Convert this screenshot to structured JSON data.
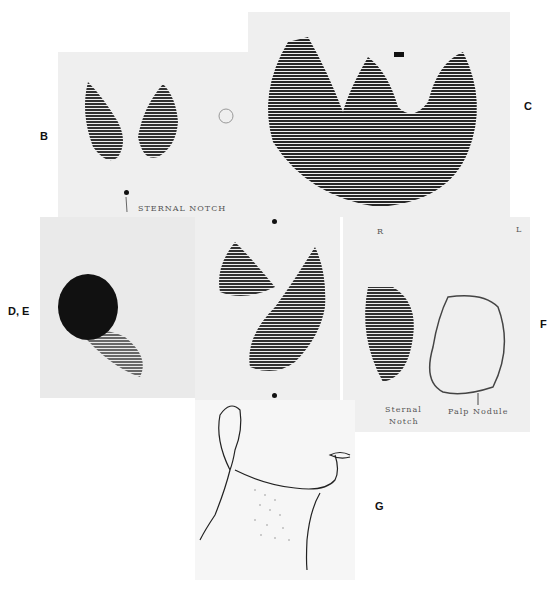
{
  "figure": {
    "panels": [
      {
        "id": "B",
        "label": "B",
        "annotations": [
          "STERNAL NOTCH"
        ]
      },
      {
        "id": "C",
        "label": "C",
        "annotations": []
      },
      {
        "id": "DE",
        "label": "D, E",
        "annotations": []
      },
      {
        "id": "middle",
        "label": "",
        "annotations": []
      },
      {
        "id": "F",
        "label": "F",
        "annotations": [
          "R",
          "L",
          "Sternal",
          "Notch",
          "Palp Nodule"
        ]
      },
      {
        "id": "G",
        "label": "G",
        "annotations": []
      }
    ]
  },
  "labels": {
    "b": "B",
    "c": "C",
    "de": "D, E",
    "f": "F",
    "g": "G"
  },
  "annotations": {
    "b_sternal_notch": "STERNAL NOTCH",
    "f_r": "R",
    "f_l": "L",
    "f_sternal": "Sternal",
    "f_notch": "Notch",
    "f_palp_nodule": "Palp Nodule"
  },
  "colors": {
    "scan_background": "#efefef",
    "scan_ink": "#111111"
  }
}
